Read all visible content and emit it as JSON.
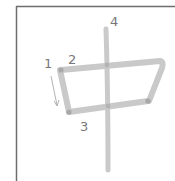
{
  "character": "中",
  "stroke_count": 4,
  "colors": {
    "frame": "#6e6e6e",
    "stroke": "#c9c9c9",
    "stroke_joint": "#9a9a9a",
    "label": "#777777",
    "arrow": "#a0a0a0"
  },
  "labels": [
    {
      "number": "1"
    },
    {
      "number": "2"
    },
    {
      "number": "3"
    },
    {
      "number": "4"
    }
  ]
}
